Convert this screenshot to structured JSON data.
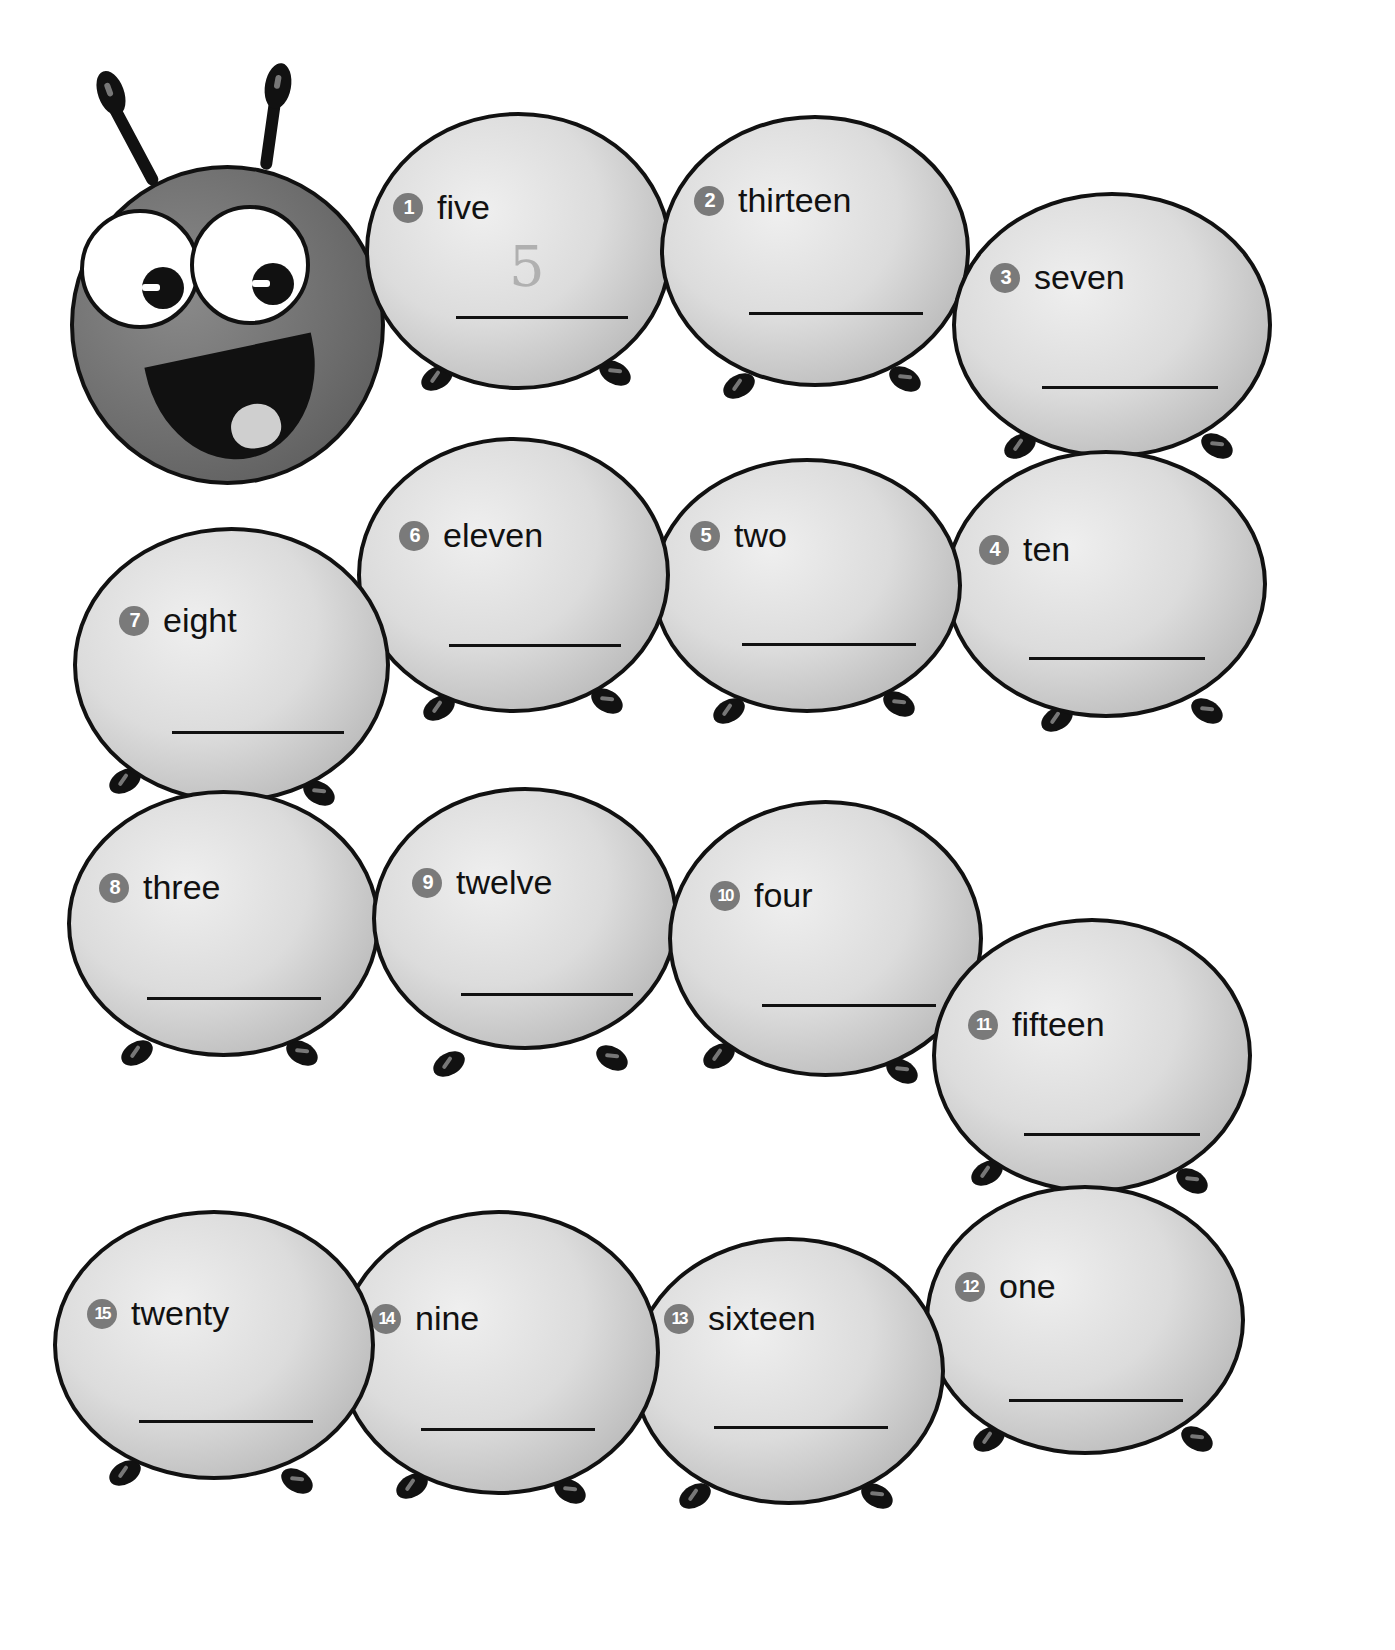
{
  "header": {
    "cut_off_instruction": "Write the number for each word."
  },
  "worksheet": {
    "title": "Caterpillar number words",
    "head": {
      "description": "smiling caterpillar head"
    },
    "segments": [
      {
        "number": "1",
        "word": "five",
        "answer": "5"
      },
      {
        "number": "2",
        "word": "thirteen",
        "answer": ""
      },
      {
        "number": "3",
        "word": "seven",
        "answer": ""
      },
      {
        "number": "4",
        "word": "ten",
        "answer": ""
      },
      {
        "number": "5",
        "word": "two",
        "answer": ""
      },
      {
        "number": "6",
        "word": "eleven",
        "answer": ""
      },
      {
        "number": "7",
        "word": "eight",
        "answer": ""
      },
      {
        "number": "8",
        "word": "three",
        "answer": ""
      },
      {
        "number": "9",
        "word": "twelve",
        "answer": ""
      },
      {
        "number": "10",
        "word": "four",
        "answer": ""
      },
      {
        "number": "11",
        "word": "fifteen",
        "answer": ""
      },
      {
        "number": "12",
        "word": "one",
        "answer": ""
      },
      {
        "number": "13",
        "word": "sixteen",
        "answer": ""
      },
      {
        "number": "14",
        "word": "nine",
        "answer": ""
      },
      {
        "number": "15",
        "word": "twenty",
        "answer": ""
      }
    ]
  },
  "colors": {
    "badge": "#7a7a7a",
    "outline": "#111111",
    "segment_fill": "#d6d6d6",
    "head_fill": "#6e6e6e"
  }
}
